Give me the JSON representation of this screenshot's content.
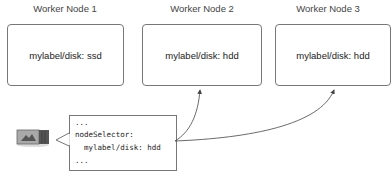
{
  "nodes": [
    {
      "title": "Worker Node 1",
      "label": "mylabel/disk: ssd"
    },
    {
      "title": "Worker Node 2",
      "label": "mylabel/disk: hdd"
    },
    {
      "title": "Worker Node 3",
      "label": "mylabel/disk: hdd"
    }
  ],
  "pod": {
    "icon": "pod-container-icon",
    "spec_lines": [
      "...",
      "nodeSelector:",
      "  mylabel/disk: hdd",
      "..."
    ]
  },
  "colors": {
    "border": "#777777",
    "arrow": "#444444",
    "text": "#222222"
  }
}
